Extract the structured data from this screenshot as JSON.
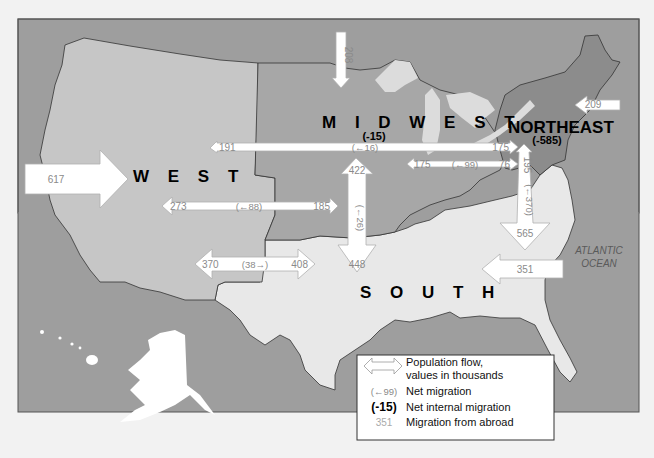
{
  "map": {
    "title": "U.S. regional population flows",
    "colors": {
      "background": "#f2f2f2",
      "ocean": "#9e9e9e",
      "west": "#c6c6c6",
      "midwest": "#a7a7a7",
      "northeast": "#8c8c8c",
      "south": "#e8e8e8",
      "lakes": "#dcdcdc",
      "arrow_fill": "#ffffff",
      "arrow_stroke": "#b0b0b0"
    },
    "regions": {
      "west": {
        "name": "W E S T"
      },
      "midwest": {
        "name": "M I D W E S T",
        "net_internal": "(-15)"
      },
      "northeast": {
        "name": "NORTHEAST",
        "net_internal": "(-585)"
      },
      "south": {
        "name": "S O U T H"
      }
    },
    "ocean_label": {
      "line1": "ATLANTIC",
      "line2": "OCEAN"
    },
    "flows": [
      {
        "id": "abroad-west",
        "from": "abroad",
        "to": "West",
        "value": "617"
      },
      {
        "id": "abroad-midwest",
        "from": "abroad",
        "to": "Midwest",
        "value": "208"
      },
      {
        "id": "abroad-northeast",
        "from": "abroad",
        "to": "Northeast",
        "value": "209"
      },
      {
        "id": "abroad-south",
        "from": "abroad",
        "to": "South",
        "value": "351"
      },
      {
        "id": "midwest-west",
        "left": "191",
        "net": "(←16)",
        "right": "175",
        "label": "West ↔ Northeast"
      },
      {
        "id": "midwest-northeast",
        "left": "175",
        "net": "(←99)",
        "right": "76"
      },
      {
        "id": "west-midwest",
        "left": "273",
        "net": "(←88)",
        "right": "185"
      },
      {
        "id": "west-south",
        "left": "370",
        "net": "(38→)",
        "right": "408"
      },
      {
        "id": "midwest-south",
        "up": "422",
        "net": "(←26)",
        "down": "448"
      },
      {
        "id": "northeast-south",
        "up": "195",
        "net": "(←370)",
        "down": "565"
      }
    ]
  },
  "legend": {
    "items": [
      {
        "symbol": "double-arrow",
        "line1": "Population flow,",
        "line2": "values in thousands"
      },
      {
        "symbol": "(←99)",
        "text": "Net migration"
      },
      {
        "symbol": "(-15)",
        "text": "Net internal migration"
      },
      {
        "symbol": "351",
        "text": "Migration from abroad"
      }
    ]
  }
}
